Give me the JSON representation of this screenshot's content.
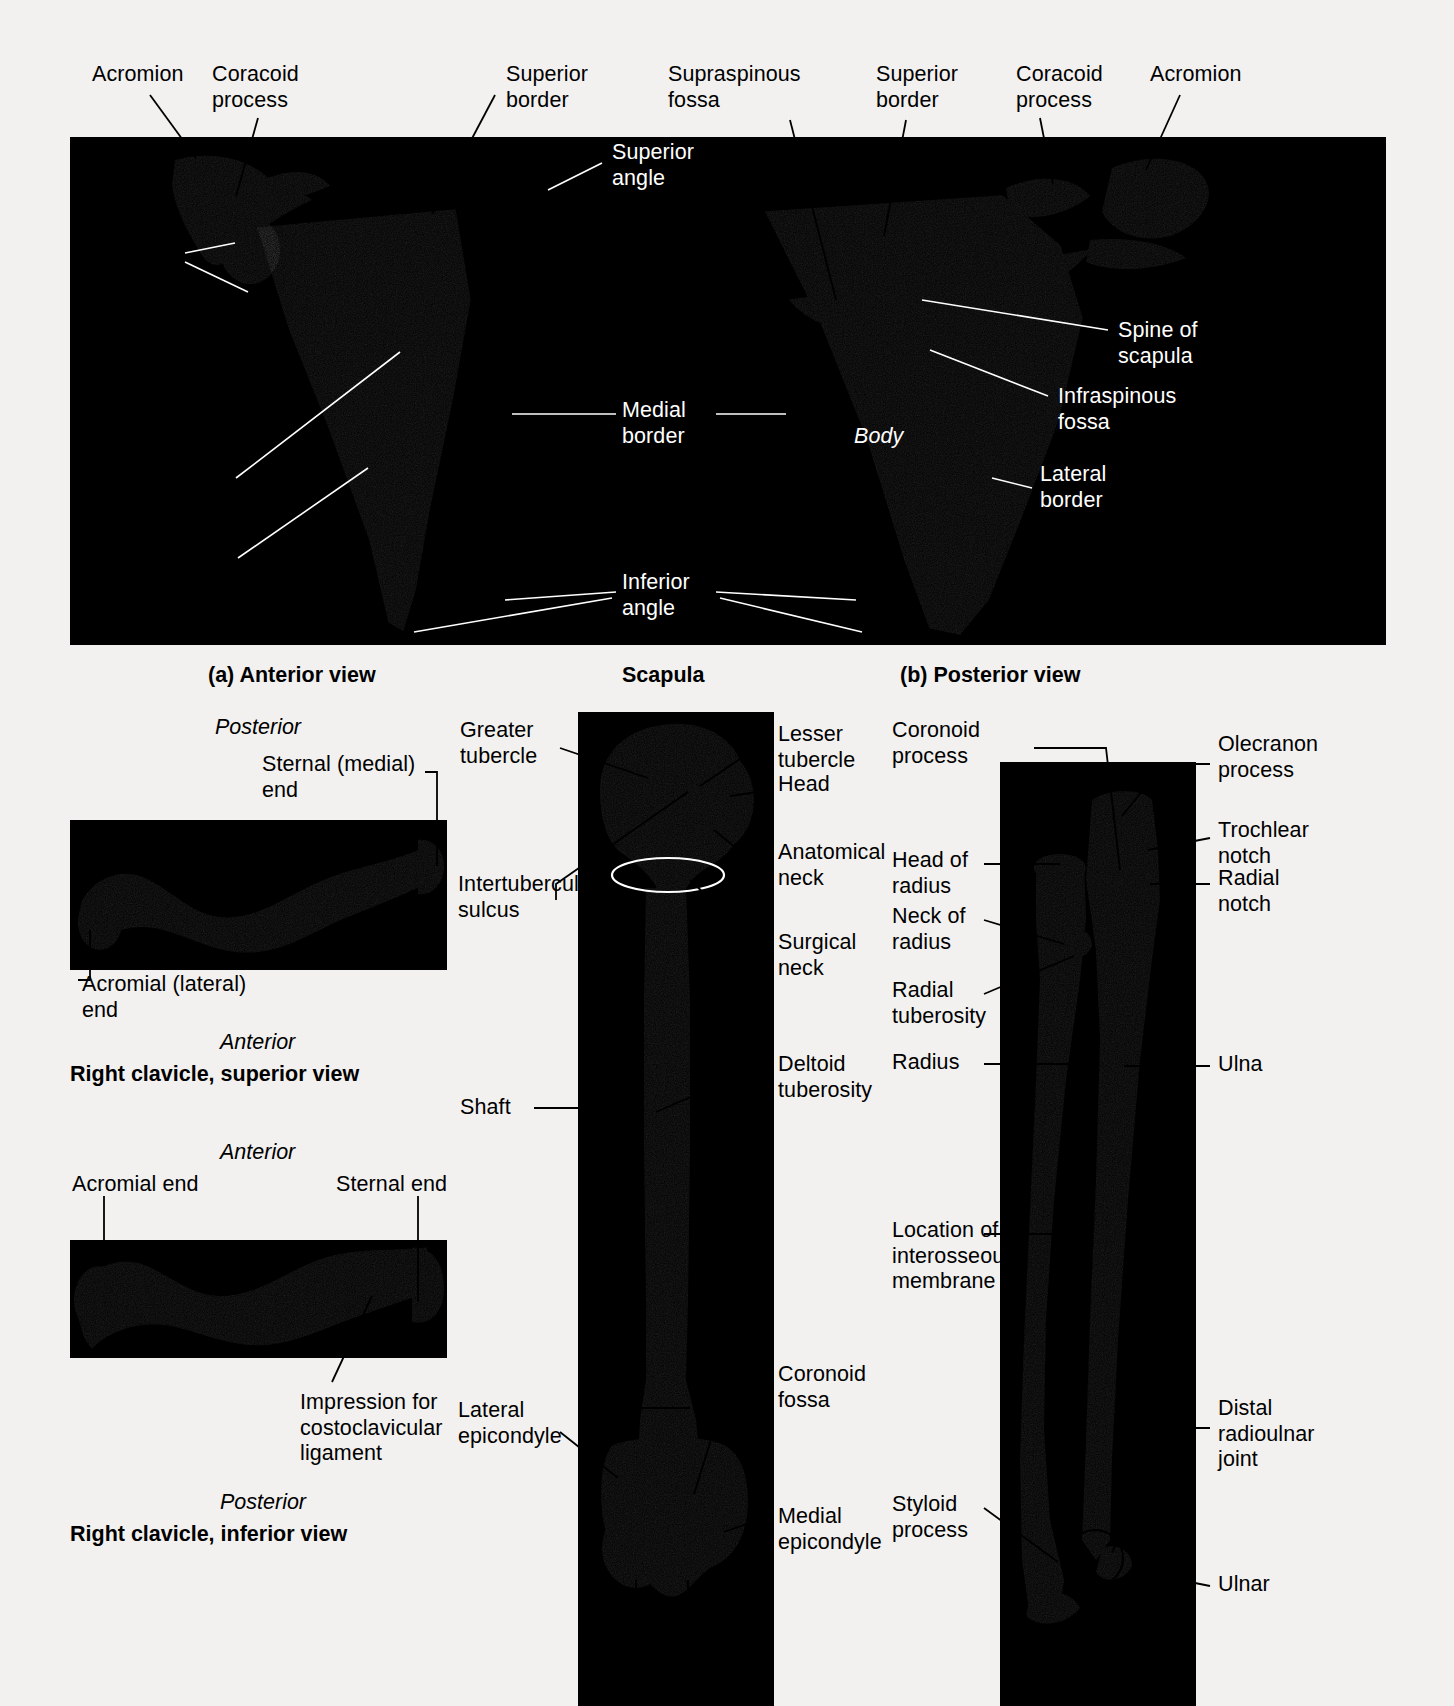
{
  "figure": {
    "background_color": "#f2f1ef",
    "photo_background": "#000000",
    "bone_color": "#cfc9bd"
  },
  "scapula_panel": {
    "caption_left": "(a) Anterior view",
    "caption_center": "Scapula",
    "caption_right": "(b) Posterior view",
    "labels_left": [
      {
        "text": "Acromion"
      },
      {
        "text": "Coracoid\nprocess"
      },
      {
        "text": "Glenoid\ncavity"
      },
      {
        "text": "Subscapular\nfossa"
      },
      {
        "text": "Lateral\nborder"
      }
    ],
    "labels_top_center": [
      {
        "text": "Superior\nborder"
      },
      {
        "text": "Supraspinous\nfossa"
      },
      {
        "text": "Superior\nborder"
      },
      {
        "text": "Coracoid\nprocess"
      },
      {
        "text": "Acromion"
      }
    ],
    "labels_inside_white": [
      {
        "text": "Superior\nangle"
      },
      {
        "text": "Medial\nborder"
      },
      {
        "text": "Body"
      },
      {
        "text": "Inferior\nangle"
      },
      {
        "text": "Spine of\nscapula"
      },
      {
        "text": "Infraspinous\nfossa"
      },
      {
        "text": "Lateral\nborder"
      }
    ]
  },
  "clavicle_superior": {
    "orientation_top": "Posterior",
    "orientation_bottom": "Anterior",
    "caption": "Right clavicle, superior view",
    "labels": [
      {
        "text": "Sternal (medial)\nend"
      },
      {
        "text": "Acromial (lateral)\nend"
      }
    ]
  },
  "clavicle_inferior": {
    "orientation_top": "Anterior",
    "orientation_bottom": "Posterior",
    "caption": "Right clavicle, inferior view",
    "labels": [
      {
        "text": "Acromial end"
      },
      {
        "text": "Sternal end"
      },
      {
        "text": "Impression for\ncostoclavicular\nligament"
      }
    ]
  },
  "humerus": {
    "labels_left": [
      {
        "text": "Greater\ntubercle"
      },
      {
        "text": "Intertubercular\nsulcus"
      },
      {
        "text": "Shaft"
      },
      {
        "text": "Lateral\nepicondyle"
      }
    ],
    "labels_right": [
      {
        "text": "Lesser\ntubercle"
      },
      {
        "text": "Head"
      },
      {
        "text": "Anatomical\nneck"
      },
      {
        "text": "Surgical\nneck"
      },
      {
        "text": "Deltoid\ntuberosity"
      },
      {
        "text": "Coronoid\nfossa"
      },
      {
        "text": "Medial\nepicondyle"
      }
    ]
  },
  "radius_ulna": {
    "labels_left": [
      {
        "text": "Coronoid\nprocess"
      },
      {
        "text": "Head of\nradius"
      },
      {
        "text": "Neck of\nradius"
      },
      {
        "text": "Radial\ntuberosity"
      },
      {
        "text": "Radius"
      },
      {
        "text": "Location of\ninterosseous\nmembrane"
      },
      {
        "text": "Styloid\nprocess"
      }
    ],
    "labels_right": [
      {
        "text": "Olecranon\nprocess"
      },
      {
        "text": "Trochlear\nnotch"
      },
      {
        "text": "Radial\nnotch"
      },
      {
        "text": "Ulna"
      },
      {
        "text": "Distal\nradioulnar\njoint"
      },
      {
        "text": "Ulnar"
      }
    ]
  }
}
